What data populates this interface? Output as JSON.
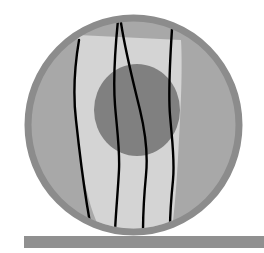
{
  "figure": {
    "title": "Cross-section schematic of layered disc with vertical fracture lines resting on a support bar",
    "canvas": {
      "width": 264,
      "height": 253,
      "background": "#ffffff"
    },
    "colors": {
      "background": "#ffffff",
      "outer_ring": "#8c8c8c",
      "outer_disc": "#a8a8a8",
      "light_band": "#d4d4d4",
      "inner_core": "#808080",
      "fracture_line": "#000000",
      "support_bar": "#909090"
    },
    "elements": {
      "outer_disc": {
        "name": "outer-disc",
        "cx": 133.5,
        "cy": 125,
        "rx": 105.5,
        "ry": 107,
        "fill": "#a8a8a8",
        "stroke": "#8c8c8c",
        "stroke_width": 7
      },
      "light_band": {
        "name": "light-band",
        "fill": "#d4d4d4",
        "path": "M 78 35 C 74 80, 74 120, 82 170 C 88 200, 94 218, 100 229 L 172 229 C 176 200, 178 160, 180 120 C 182 85, 182 55, 181 40 Z"
      },
      "inner_core": {
        "name": "inner-core",
        "cx": 137,
        "cy": 110,
        "rx": 43,
        "ry": 46,
        "fill": "#808080"
      },
      "support_bar": {
        "name": "support-bar",
        "x": 24,
        "y": 236,
        "width": 240,
        "height": 12,
        "fill": "#909090"
      },
      "fracture_lines": [
        {
          "name": "fracture-line-1",
          "path": "M 79 40 C 74 70, 73 95, 76 120 C 79 148, 83 180, 87 205 C 89 216, 90 224, 91 230"
        },
        {
          "name": "fracture-line-2",
          "path": "M 118 20 C 115 50, 113 80, 115 105 C 117 130, 120 150, 119 170 C 118 190, 116 210, 115 231"
        },
        {
          "name": "fracture-line-3",
          "path": "M 121 23 C 126 55, 134 85, 140 110 C 146 135, 148 155, 146 175 C 144 196, 143 215, 143 232"
        },
        {
          "name": "fracture-line-4",
          "path": "M 172 29 C 170 60, 168 90, 170 115 C 172 140, 175 160, 173 180 C 171 200, 170 216, 170 228"
        }
      ]
    },
    "fracture_line_width": 2.4,
    "fracture_line_count": 4
  }
}
